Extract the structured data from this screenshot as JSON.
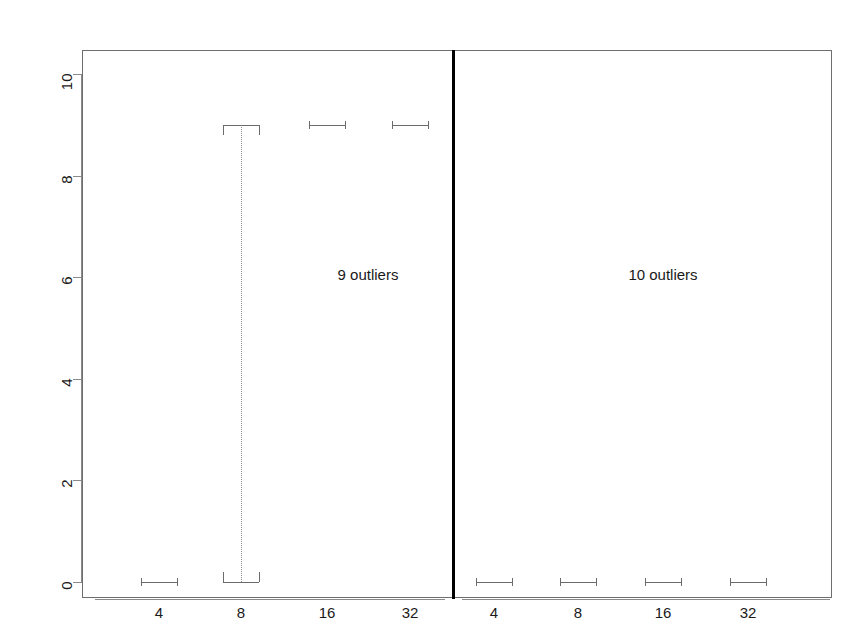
{
  "chart_data": {
    "type": "boxplot",
    "title": "",
    "xlabel": "",
    "ylabel": "",
    "ylim": [
      0,
      10
    ],
    "yticks": [
      0,
      2,
      4,
      6,
      8,
      10
    ],
    "ytick_labels": [
      "0",
      "2",
      "4",
      "6",
      "8",
      "10"
    ],
    "grid": false,
    "legend": "none",
    "panels": [
      {
        "name": "left-panel",
        "annotation": "9 outliers",
        "categories": [
          "4",
          "8",
          "16",
          "32"
        ],
        "boxes": [
          {
            "category": "4",
            "lower_whisker": 0,
            "q1": 0,
            "median": 0,
            "q3": 0,
            "upper_whisker": 0,
            "shape": "flat"
          },
          {
            "category": "8",
            "lower_whisker": 0,
            "q1": 0,
            "median": 0,
            "q3": 9,
            "upper_whisker": 9,
            "shape": "tall-open"
          },
          {
            "category": "16",
            "lower_whisker": 9,
            "q1": 9,
            "median": 9,
            "q3": 9,
            "upper_whisker": 9,
            "shape": "flat"
          },
          {
            "category": "32",
            "lower_whisker": 9,
            "q1": 9,
            "median": 9,
            "q3": 9,
            "upper_whisker": 9,
            "shape": "flat"
          }
        ]
      },
      {
        "name": "right-panel",
        "annotation": "10 outliers",
        "categories": [
          "4",
          "8",
          "16",
          "32"
        ],
        "boxes": [
          {
            "category": "4",
            "lower_whisker": 0,
            "q1": 0,
            "median": 0,
            "q3": 0,
            "upper_whisker": 0,
            "shape": "flat"
          },
          {
            "category": "8",
            "lower_whisker": 0,
            "q1": 0,
            "median": 0,
            "q3": 0,
            "upper_whisker": 0,
            "shape": "flat"
          },
          {
            "category": "16",
            "lower_whisker": 0,
            "q1": 0,
            "median": 0,
            "q3": 0,
            "upper_whisker": 0,
            "shape": "flat"
          },
          {
            "category": "32",
            "lower_whisker": 0,
            "q1": 0,
            "median": 0,
            "q3": 0,
            "upper_whisker": 0,
            "shape": "flat"
          }
        ]
      }
    ],
    "colors": {
      "box_stroke": "#6b6b6b",
      "whisker": "#8d8d8d",
      "axis": "#8a8a8a",
      "frame": "#6e6e6e",
      "divider": "#000000",
      "text": "#1a1a1a",
      "background": "#ffffff"
    }
  },
  "axes": {
    "y_labels": [
      "0",
      "2",
      "4",
      "6",
      "8",
      "10"
    ],
    "x_labels_left": [
      "4",
      "8",
      "16",
      "32"
    ],
    "x_labels_right": [
      "4",
      "8",
      "16",
      "32"
    ]
  },
  "annotations": {
    "left": "9 outliers",
    "right": "10 outliers"
  }
}
